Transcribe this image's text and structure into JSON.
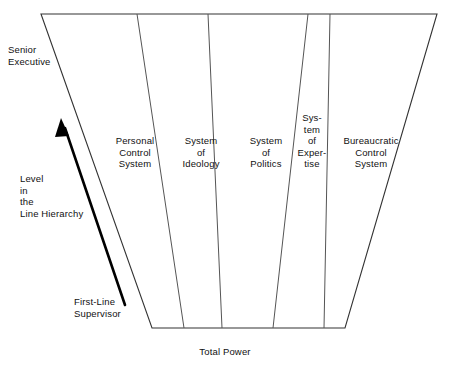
{
  "diagram": {
    "type": "conceptual-trapezoid-diagram",
    "colors": {
      "background": "#ffffff",
      "outline": "#333333",
      "divider": "#555555",
      "text": "#111111",
      "arrow": "#000000"
    },
    "bands": [
      {
        "id": "personal-control-system",
        "label": "Personal\nControl\nSystem"
      },
      {
        "id": "system-of-ideology",
        "label": "System\nof\nIdeology"
      },
      {
        "id": "system-of-politics",
        "label": "System\nof\nPolitics"
      },
      {
        "id": "system-of-expertise",
        "label": "Sys-\ntem\nof\nExper-\ntise"
      },
      {
        "id": "bureaucratic-control-system",
        "label": "Bureaucratic\nControl\nSystem"
      }
    ],
    "vertical_axis": {
      "top_label": "Senior\nExecutive",
      "middle_label": "Level\nin\nthe\nLine Hierarchy",
      "bottom_label": "First-Line\nSupervisor",
      "arrow_direction": "up"
    },
    "horizontal_axis": {
      "label": "Total Power",
      "arrow_direction": "both"
    }
  }
}
